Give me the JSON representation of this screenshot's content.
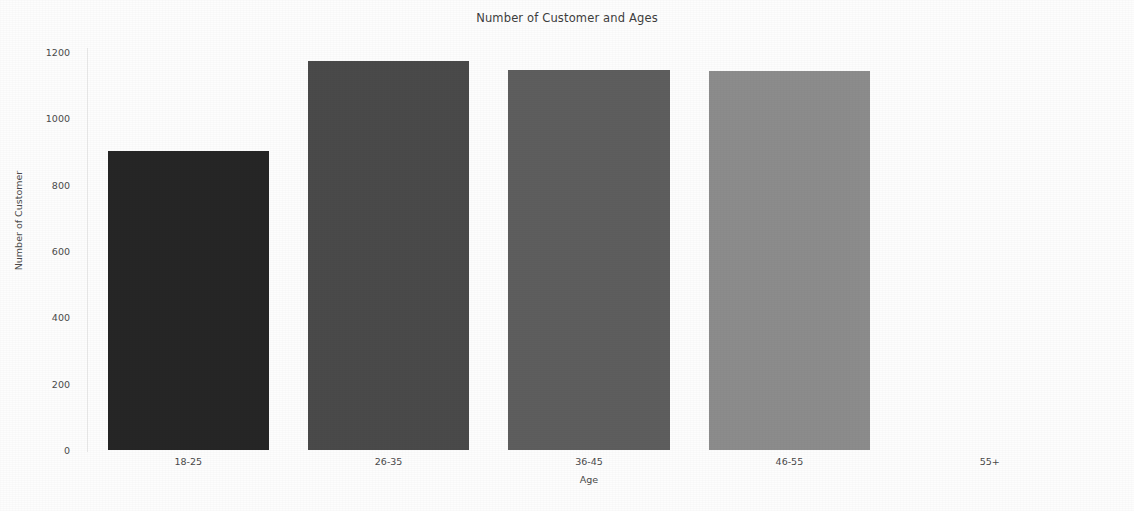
{
  "chart_data": {
    "type": "bar",
    "title": "Number of Customer and Ages",
    "xlabel": "Age",
    "ylabel": "Number of Customer",
    "categories": [
      "18-25",
      "26-35",
      "36-45",
      "46-55",
      "55+"
    ],
    "values": [
      901,
      1173,
      1146,
      1143,
      0
    ],
    "bar_colors": [
      "#262626",
      "#4a4a4a",
      "#5e5e5e",
      "#8c8c8c",
      "#b5b5b5"
    ],
    "ylim": [
      0,
      1200
    ],
    "yticks": [
      0,
      200,
      400,
      600,
      800,
      1000,
      1200
    ],
    "ytick_labels": [
      "0",
      "200",
      "400",
      "600",
      "800",
      "1000",
      "1200"
    ],
    "grid": false,
    "legend": false,
    "background": "#fdfdfd"
  }
}
